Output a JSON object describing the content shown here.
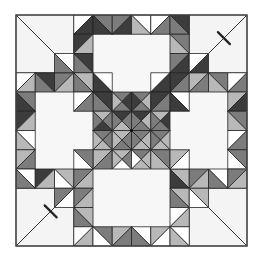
{
  "figure": {
    "origin": [
      16,
      15
    ],
    "cell": 19.25,
    "grid": 12
  },
  "palette": {
    "W": "#ffffff",
    "L": "#b8b8b8",
    "M": "#7c7c7c",
    "D": "#3c3c3c",
    "corner": "#f4f4f4",
    "heart": "#f7f7f7"
  },
  "corners": [
    {
      "name": "corner-top-left",
      "x": 0,
      "y": 0,
      "w": 3,
      "h": 3,
      "diag": "\\",
      "notch": false
    },
    {
      "name": "corner-top-right",
      "x": 9,
      "y": 0,
      "w": 3,
      "h": 3,
      "diag": "/",
      "notch": true
    },
    {
      "name": "corner-bottom-left",
      "x": 0,
      "y": 9,
      "w": 3,
      "h": 3,
      "diag": "/",
      "notch": true
    },
    {
      "name": "corner-bottom-right",
      "x": 9,
      "y": 9,
      "w": 3,
      "h": 3,
      "diag": "\\",
      "notch": false
    }
  ],
  "hearts": [
    {
      "name": "heart-top",
      "x": 4,
      "y": 1,
      "w": 4,
      "h": 3
    },
    {
      "name": "heart-left",
      "x": 1,
      "y": 4,
      "w": 3,
      "h": 4
    },
    {
      "name": "heart-right",
      "x": 8,
      "y": 4,
      "w": 3,
      "h": 4
    },
    {
      "name": "heart-bottom",
      "x": 4,
      "y": 8,
      "w": 4,
      "h": 3
    }
  ],
  "cells": [
    [
      3,
      0,
      "/",
      "W",
      "D"
    ],
    [
      4,
      0,
      "\\",
      "M",
      "D"
    ],
    [
      5,
      0,
      "/",
      "M",
      "D"
    ],
    [
      6,
      0,
      "\\",
      "W",
      "L"
    ],
    [
      7,
      0,
      "/",
      "W",
      "M"
    ],
    [
      8,
      0,
      "\\",
      "D",
      "M"
    ],
    [
      3,
      1,
      "/",
      "D",
      "L"
    ],
    [
      8,
      1,
      "\\",
      "M",
      "L"
    ],
    [
      3,
      2,
      "\\",
      "D",
      "M"
    ],
    [
      8,
      2,
      "/",
      "M",
      "D"
    ],
    [
      3,
      3,
      "\\",
      "M",
      "D"
    ],
    [
      8,
      3,
      "/",
      "D",
      "M"
    ],
    [
      4,
      3,
      "\\",
      "W",
      "D"
    ],
    [
      7,
      3,
      "/",
      "W",
      "D"
    ],
    [
      0,
      3,
      "/",
      "W",
      "L"
    ],
    [
      1,
      3,
      "\\",
      "D",
      "M"
    ],
    [
      2,
      3,
      "/",
      "M",
      "L"
    ],
    [
      3,
      3,
      "\\",
      "L",
      "M"
    ],
    [
      9,
      3,
      "/",
      "L",
      "M"
    ],
    [
      10,
      3,
      "\\",
      "M",
      "L"
    ],
    [
      11,
      3,
      "/",
      "W",
      "M"
    ],
    [
      0,
      4,
      "\\",
      "M",
      "D"
    ],
    [
      11,
      4,
      "/",
      "L",
      "D"
    ],
    [
      0,
      5,
      "/",
      "D",
      "L"
    ],
    [
      11,
      5,
      "\\",
      "M",
      "L"
    ],
    [
      0,
      6,
      "\\",
      "W",
      "L"
    ],
    [
      11,
      6,
      "/",
      "W",
      "M"
    ],
    [
      0,
      7,
      "/",
      "L",
      "M"
    ],
    [
      11,
      7,
      "\\",
      "M",
      "W"
    ],
    [
      0,
      8,
      "\\",
      "W",
      "M"
    ],
    [
      1,
      8,
      "/",
      "D",
      "L"
    ],
    [
      2,
      8,
      "\\",
      "L",
      "W"
    ],
    [
      3,
      8,
      "/",
      "M",
      "L"
    ],
    [
      8,
      8,
      "\\",
      "L",
      "D"
    ],
    [
      9,
      8,
      "/",
      "M",
      "L"
    ],
    [
      10,
      8,
      "\\",
      "W",
      "M"
    ],
    [
      11,
      8,
      "/",
      "M",
      "L"
    ],
    [
      3,
      9,
      "/",
      "M",
      "L"
    ],
    [
      8,
      9,
      "\\",
      "L",
      "M"
    ],
    [
      3,
      10,
      "\\",
      "L",
      "M"
    ],
    [
      8,
      10,
      "/",
      "W",
      "L"
    ],
    [
      3,
      11,
      "/",
      "W",
      "L"
    ],
    [
      4,
      11,
      "\\",
      "M",
      "W"
    ],
    [
      5,
      11,
      "/",
      "L",
      "M"
    ],
    [
      6,
      11,
      "\\",
      "W",
      "M"
    ],
    [
      7,
      11,
      "/",
      "L",
      "W"
    ],
    [
      8,
      11,
      "\\",
      "W",
      "L"
    ],
    [
      4,
      4,
      "\\",
      "D",
      "M"
    ],
    [
      5,
      4,
      "x",
      "M",
      "D",
      "M",
      "L"
    ],
    [
      6,
      4,
      "x",
      "M",
      "L",
      "M",
      "D"
    ],
    [
      7,
      4,
      "/",
      "D",
      "M"
    ],
    [
      4,
      5,
      "x",
      "L",
      "M",
      "D",
      "M"
    ],
    [
      5,
      5,
      "x",
      "D",
      "M",
      "L",
      "M"
    ],
    [
      6,
      5,
      "x",
      "D",
      "L",
      "M",
      "M"
    ],
    [
      7,
      5,
      "x",
      "L",
      "D",
      "M",
      "M"
    ],
    [
      4,
      6,
      "x",
      "M",
      "M",
      "L",
      "L"
    ],
    [
      5,
      6,
      "x",
      "L",
      "M",
      "M",
      "L"
    ],
    [
      6,
      6,
      "x",
      "M",
      "L",
      "L",
      "M"
    ],
    [
      7,
      6,
      "x",
      "M",
      "L",
      "L",
      "M"
    ],
    [
      4,
      7,
      "/",
      "L",
      "M"
    ],
    [
      5,
      7,
      "x",
      "L",
      "M",
      "W",
      "L"
    ],
    [
      6,
      7,
      "x",
      "M",
      "L",
      "L",
      "W"
    ],
    [
      7,
      7,
      "\\",
      "M",
      "L"
    ],
    [
      2,
      2,
      "\\",
      "W",
      "M"
    ],
    [
      9,
      2,
      "/",
      "W",
      "D"
    ],
    [
      2,
      9,
      "/",
      "M",
      "W"
    ],
    [
      9,
      9,
      "\\",
      "L",
      "W"
    ],
    [
      3,
      4,
      "/",
      "W",
      "M"
    ],
    [
      8,
      4,
      "\\",
      "W",
      "D"
    ],
    [
      3,
      7,
      "\\",
      "M",
      "W"
    ],
    [
      8,
      7,
      "/",
      "L",
      "W"
    ]
  ]
}
